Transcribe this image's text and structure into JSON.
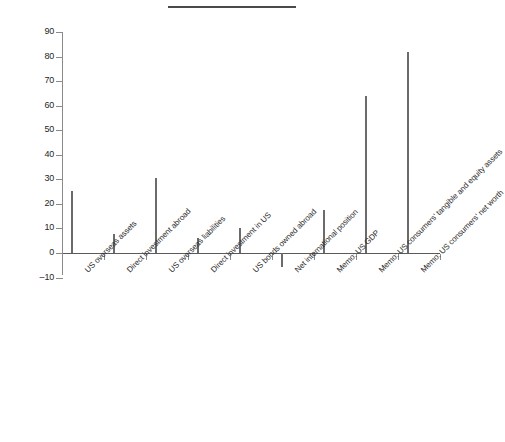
{
  "figure": {
    "title": "",
    "title_redacted": true,
    "background_color": "#ffffff",
    "bar_color": "#808080",
    "bar_edge_color": "#6b6b6b",
    "axis_color": "#8a8a8a"
  },
  "chart_data": {
    "type": "bar",
    "title": "",
    "xlabel": "",
    "ylabel": "",
    "ylim": [
      -10,
      90
    ],
    "ytick_step": 10,
    "grid": false,
    "legend": null,
    "categories": [
      "US overseas assets",
      "Direct investment abroad",
      "US overseas liabilities",
      "Direct investment in US",
      "US bonds owned abroad",
      "Net international position",
      "Memo: US GDP",
      "Memo: US consumers' tangible and equity assets",
      "Memo: US consumers' net worth"
    ],
    "values": [
      25.1,
      7.6,
      30.5,
      6.1,
      10.3,
      -5.8,
      17.4,
      63.8,
      81.8
    ],
    "ytick_labels": [
      "90",
      "80",
      "70",
      "60",
      "50",
      "40",
      "30",
      "20",
      "10",
      "0",
      "-10"
    ],
    "ytick_values": [
      90,
      80,
      70,
      60,
      50,
      40,
      30,
      20,
      10,
      0,
      -10
    ]
  }
}
